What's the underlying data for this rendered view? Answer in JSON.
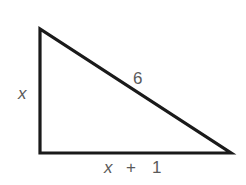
{
  "diagram": {
    "type": "right-triangle",
    "colors": {
      "stroke": "#1a1a1a",
      "label": "#5a5a5a",
      "background": "#ffffff"
    },
    "sides": {
      "vertical": {
        "label": "x"
      },
      "hypotenuse": {
        "label": "6"
      },
      "horizontal": {
        "label_var": "x",
        "label_op": "+",
        "label_const": "1"
      }
    }
  }
}
